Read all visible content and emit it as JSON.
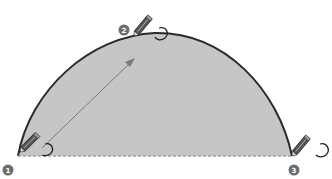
{
  "diagram": {
    "type": "arc-drawing-steps",
    "shape": {
      "kind": "half-ellipse-arc",
      "fill_color": "#c6c6c6",
      "stroke_color": "#2a2a2a",
      "baseline_style": "dashed",
      "baseline_color": "#9a9a9a"
    },
    "steps": [
      {
        "number": "1",
        "label": "start-point",
        "x": 18,
        "y": 156,
        "badge_x": 8,
        "badge_y": 170
      },
      {
        "number": "2",
        "label": "mid-point",
        "x": 134,
        "y": 36,
        "badge_x": 124,
        "badge_y": 30
      },
      {
        "number": "3",
        "label": "end-point",
        "x": 292,
        "y": 156,
        "badge_x": 294,
        "badge_y": 170
      }
    ],
    "arrow": {
      "from": "start-point",
      "to": "mid-point",
      "color": "#7a7a7a"
    },
    "icons": [
      "pencil-icon",
      "click-curl-icon",
      "arrow-icon"
    ],
    "badge_color": "#6e6e6e"
  }
}
